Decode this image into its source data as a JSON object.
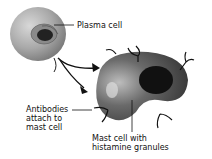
{
  "labels": {
    "plasma_cell": "Plasma cell",
    "antibodies": [
      "Antibodies",
      "attach to",
      "mast cell"
    ],
    "mast_cell": [
      "Mast cell with",
      "histamine granules"
    ]
  }
}
